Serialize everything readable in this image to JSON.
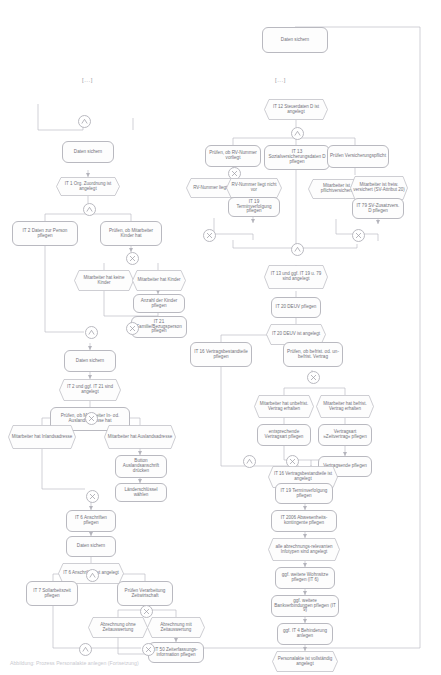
{
  "diagram": {
    "caption": "Abbildung:  Prozess Personalakte anlegen (Fortsetzung)",
    "break_marker": "[...]",
    "connector_and": "AND",
    "connector_xor": "XOR"
  },
  "nodes": {
    "top_save": "Daten sichern",
    "l_and_1": "AND",
    "l_save_1": "Daten sichern",
    "l_ev_it1": "IT 1 Org. Zuordnung ist angelegt",
    "l_and_2": "AND",
    "l_fn_it2": "IT 2 Daten zur Person pflegen",
    "l_fn_kinder": "Prüfen, ob Mitarbeiter Kinder hat",
    "l_xor_1": "XOR",
    "l_ev_keine_kinder": "Mitarbeiter hat keine Kinder",
    "l_ev_kinder": "Mitarbeiter hat Kinder",
    "l_fn_anzahl": "Anzahl der Kinder pflegen",
    "l_fn_it21": "IT 21 Familie/Bezugsperson pflegen",
    "l_xor_2": "XOR",
    "l_and_3": "AND",
    "l_save_2": "Daten sichern",
    "l_ev_it2_it21": "IT 2 und ggf. IT 21 sind angelegt",
    "l_fn_adresse": "Prüfen, ob Mitarbeiter In- od. Auslandsadresse hat",
    "l_xor_3": "XOR",
    "l_ev_inland": "Mitarbeiter hat Inlandsadresse",
    "l_ev_ausland": "Mitarbeiter hat Auslandsadresse",
    "l_fn_button": "Button Auslandsanschrift drücken",
    "l_fn_laender": "Länderschlüssel wählen",
    "l_xor_4": "XOR",
    "l_and_4": "AND",
    "l_fn_it6": "IT 6 Anschriften pflegen",
    "l_save_3": "Daten sichern",
    "l_ev_it6": "IT 6 Anschriften ist angelegt",
    "l_and_5": "AND",
    "l_fn_it7": "IT 7 Sollarbeitszeit pflegen",
    "l_fn_zeitwirt": "Prüfen Verarbeitung Zeitwirtschaft",
    "l_xor_5": "XOR",
    "l_ev_ohne_zeit": "Abrechnung ohne Zeitauswertung",
    "l_ev_mit_zeit": "Abrechnung mit Zeitauswertung",
    "l_fn_it50": "IT 50 Zeiterfassungs-information pflegen",
    "l_xor_6": "XOR",
    "l_and_6": "AND",
    "r_ev_it12": "IT 12 Steuerdaten D ist angelegt",
    "r_and_1": "AND",
    "r_fn_rvnr": "Prüfen, ob RV-Nummer vorliegt",
    "r_fn_it13": "IT 13 Sozialversicherungsdaten D pflegen",
    "r_fn_verspflicht": "Prüfen Versicherungspflicht",
    "r_xor_1": "XOR",
    "r_ev_rv_vor": "RV-Nummer liegt vor",
    "r_ev_rv_nicht": "RV-Nummer liegt nicht vor",
    "r_fn_it19a": "IT 19 Terminverfolgung pflegen",
    "r_xor_2": "XOR",
    "r_xor_3": "XOR",
    "r_ev_pflicht": "Mitarbeiter ist pflichtversichert",
    "r_ev_freiw": "Mitarbeiter ist freiw. versichert (SV-Attribut 20)",
    "r_fn_it79": "IT 79 SV-Zusatzvers. D pflegen",
    "r_xor_4": "XOR",
    "r_and_2": "AND",
    "r_ev_it13": "IT 13 und ggf. IT 19 u. 79 sind angelegt",
    "r_fn_it20": "IT 20 DEUV pflegen",
    "r_ev_it20": "IT 20 DEUV ist angelegt",
    "r_and_3": "AND",
    "r_fn_it16": "IT 16 Vertragsbestandteile pflegen",
    "r_fn_vertrag_pruef": "Prüfen, ob befrist. od. un-befrist. Vertrag",
    "r_xor_5": "XOR",
    "r_ev_unbefrist": "Mitarbeiter hat unbefrist. Vertrag erhalten",
    "r_ev_befrist": "Mitarbeiter hat befrist. Vertrag erhalten",
    "r_fn_entspr": "entsprechende Vertragsart pflegen",
    "r_fn_zeitvertrag": "Vertragsart »Zeitvertrag« pflegen",
    "r_fn_vertragsende": "Vertragsende pflegen",
    "r_xor_6": "XOR",
    "r_and_4": "AND",
    "r_ev_it16": "IT 16 Vertragsbestandteile ist angelegt",
    "r_fn_it19b": "IT 19 Terminverfolgung pflegen",
    "r_fn_it2006": "IT 2006 Abwesenheits-kontingente pflegen",
    "r_ev_infotypen": "alle abrechnungs-relevanten Infotypen sind angelegt",
    "r_fn_wohnsitze": "ggf. weitere Wohnsitze pflegen (IT 6)",
    "r_fn_bank": "ggf. weitere Bankverbindungen pflegen (IT 9)",
    "r_fn_it4": "ggf. IT 4 Behinderung anlegen",
    "r_ev_final": "Personalakte ist vollständig angelegt"
  },
  "colors": {
    "stroke": "#b9b9c0",
    "fill": "#fdfdfd",
    "text": "#72727a",
    "wire": "#b0b0b8"
  }
}
